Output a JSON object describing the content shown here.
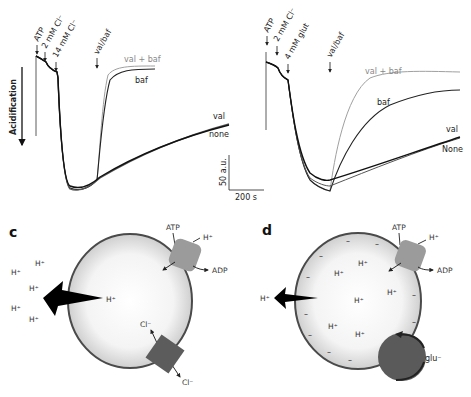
{
  "panel_a": {
    "annotations": {
      "atp": "ATP",
      "cl2": "2 mM Cl⁻",
      "cl14": "14 mM Cl⁻",
      "valbaf": "val/baf"
    },
    "trace_labels": {
      "val_baf": "val + baf",
      "baf": "baf",
      "val": "val",
      "none": "none"
    },
    "y_axis_label": "Acidification",
    "scale_bar": {
      "y": "50 a.u.",
      "x": "200 s"
    }
  },
  "panel_b": {
    "annotations": {
      "atp": "ATP",
      "cl2": "2 mM Cl⁻",
      "glut": "4 mM glut",
      "valbaf": "val/baf"
    },
    "trace_labels": {
      "val_baf": "val + baf",
      "baf": "baf",
      "val": "val",
      "none": "None"
    }
  },
  "panel_c": {
    "letter": "c",
    "atp": "ATP",
    "adp": "ADP",
    "h_pump": "H⁺",
    "h_inside": "H⁺",
    "cl_in": "Cl⁻",
    "cl_out": "Cl⁻",
    "h_outside": [
      "H⁺",
      "H⁺",
      "H⁺",
      "H⁺",
      "H⁺"
    ]
  },
  "panel_d": {
    "letter": "d",
    "atp": "ATP",
    "adp": "ADP",
    "h_pump": "H⁺",
    "h_outside": "H⁺",
    "glu": "glu⁻",
    "h_inside": [
      "H⁺",
      "H⁺",
      "H⁺",
      "H⁺",
      "H⁺",
      "H⁺"
    ]
  },
  "colors": {
    "trace_dark": "#1a1a1a",
    "trace_gray": "#9a9a9a",
    "pump": "#9b9b9b",
    "cl_channel": "#5c5c5c",
    "glu_transporter": "#5a5a5a",
    "vesicle_edge": "#4a4a4a"
  }
}
